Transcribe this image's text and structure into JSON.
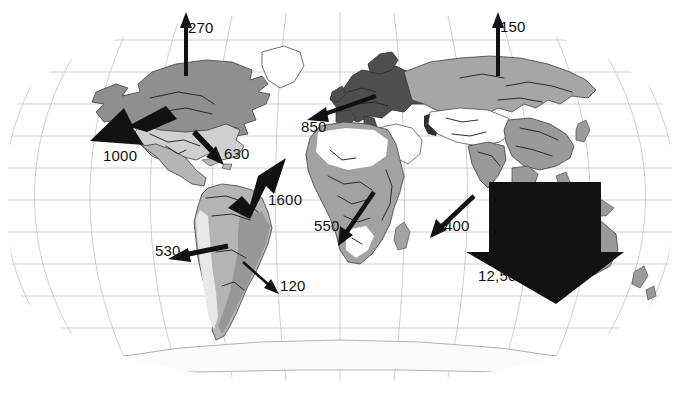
{
  "figure": {
    "type": "thematic-world-map",
    "projection": "robinson",
    "background_color": "#ffffff",
    "arrow_color": "#111111",
    "graticule_color": "#c8c8c8",
    "coastline_color": "#4a4a4a"
  },
  "land_shading": {
    "legend_note_visible": false,
    "tones": {
      "darkest": "#4b4b4b",
      "dark": "#8e8e8e",
      "medium": "#a8a8a8",
      "light": "#c6c6c6",
      "lightest": "#e3e3e3",
      "blank": "#ffffff"
    }
  },
  "flows": [
    {
      "id": "flow-north-america-north",
      "value": "270",
      "label_x": 188,
      "label_y": 20,
      "tail_x": 186,
      "tail_y": 72,
      "head_x": 186,
      "head_y": 14,
      "width": 4,
      "head_size": 9,
      "style": "thin"
    },
    {
      "id": "flow-asia-north",
      "value": "150",
      "label_x": 500,
      "label_y": 19,
      "tail_x": 498,
      "tail_y": 72,
      "head_x": 498,
      "head_y": 13,
      "width": 4,
      "head_size": 9,
      "style": "thin"
    },
    {
      "id": "flow-north-america-west",
      "value": "1000",
      "label_x": 103,
      "label_y": 148,
      "tail_x": 160,
      "tail_y": 112,
      "head_x": 92,
      "head_y": 141,
      "width": 13,
      "head_size": 20,
      "style": "thick"
    },
    {
      "id": "flow-europe-west",
      "value": "850",
      "label_x": 301,
      "label_y": 119,
      "tail_x": 375,
      "tail_y": 97,
      "head_x": 309,
      "head_y": 119,
      "width": 5,
      "head_size": 12,
      "style": "thin"
    },
    {
      "id": "flow-north-america-south",
      "value": "630",
      "label_x": 224,
      "label_y": 146,
      "tail_x": 196,
      "tail_y": 134,
      "head_x": 222,
      "head_y": 163,
      "width": 6,
      "head_size": 13,
      "style": "thin"
    },
    {
      "id": "flow-south-america-north",
      "value": "1600",
      "label_x": 268,
      "label_y": 192,
      "tail_x": 234,
      "tail_y": 204,
      "head_x": 284,
      "head_y": 163,
      "width": 15,
      "head_size": 23,
      "style": "thick"
    },
    {
      "id": "flow-south-america-west",
      "value": "530",
      "label_x": 155,
      "label_y": 243,
      "tail_x": 225,
      "tail_y": 247,
      "head_x": 170,
      "head_y": 259,
      "width": 6,
      "head_size": 14,
      "style": "thin"
    },
    {
      "id": "flow-south-america-south",
      "value": "120",
      "label_x": 280,
      "label_y": 278,
      "tail_x": 243,
      "tail_y": 263,
      "head_x": 277,
      "head_y": 292,
      "width": 3,
      "head_size": 9,
      "style": "thin"
    },
    {
      "id": "flow-africa-southwest",
      "value": "550",
      "label_x": 314,
      "label_y": 218,
      "tail_x": 373,
      "tail_y": 193,
      "head_x": 340,
      "head_y": 243,
      "width": 5,
      "head_size": 13,
      "style": "thin"
    },
    {
      "id": "flow-africa-east",
      "value": "400",
      "label_x": 444,
      "label_y": 218,
      "tail_x": 473,
      "tail_y": 197,
      "head_x": 434,
      "head_y": 235,
      "width": 5,
      "head_size": 13,
      "style": "thin"
    },
    {
      "id": "flow-southeast-asia",
      "value": "12,500",
      "label_x": 478,
      "label_y": 268,
      "tail_x": 0,
      "tail_y": 0,
      "head_x": 0,
      "head_y": 0,
      "width": 0,
      "head_size": 0,
      "style": "giant"
    }
  ]
}
